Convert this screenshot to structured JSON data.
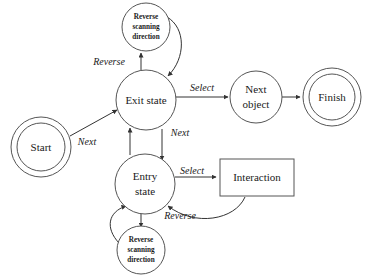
{
  "diagram": {
    "background_color": "#ffffff",
    "stroke_color": "#555555",
    "edge_color": "#333333",
    "text_color": "#1a1a1a",
    "nodes": [
      {
        "id": "start",
        "kind": "double-circle",
        "label": "Start",
        "cx": 41,
        "cy": 147,
        "r": 30,
        "r_inner": 24
      },
      {
        "id": "exit-state",
        "kind": "circle",
        "label": "Exit state",
        "cx": 146,
        "cy": 100,
        "r": 30
      },
      {
        "id": "entry-state",
        "kind": "circle",
        "label_line1": "Entry",
        "label_line2": "state",
        "cx": 145,
        "cy": 184,
        "r": 30
      },
      {
        "id": "reverse-scanning-direction-top",
        "kind": "circle-small",
        "label_line1": "Reverse",
        "label_line2": "scanning",
        "label_line3": "direction",
        "cx": 146,
        "cy": 27,
        "r": 24
      },
      {
        "id": "reverse-scanning-direction-bottom",
        "kind": "circle-small",
        "label_line1": "Reverse",
        "label_line2": "scanning",
        "label_line3": "direction",
        "cx": 141,
        "cy": 250,
        "r": 24
      },
      {
        "id": "next-object",
        "kind": "circle",
        "label_line1": "Next",
        "label_line2": "object",
        "cx": 256,
        "cy": 97,
        "r": 26
      },
      {
        "id": "finish",
        "kind": "double-circle",
        "label": "Finish",
        "cx": 332,
        "cy": 97,
        "r": 29,
        "r_inner": 23
      },
      {
        "id": "interaction",
        "kind": "rect",
        "label": "Interaction",
        "x": 220,
        "y": 159,
        "width": 74,
        "height": 37
      }
    ],
    "edges": [
      {
        "id": "start-to-exit",
        "label": "Next",
        "label_x": 87,
        "label_y": 143,
        "from": "start",
        "to": "exit-state"
      },
      {
        "id": "exit-to-reverse-top",
        "label": "Reverse",
        "label_x": 109,
        "label_y": 63,
        "from": "exit-state",
        "to": "reverse-scanning-direction-top"
      },
      {
        "id": "reverse-top-to-exit",
        "label": "",
        "from": "reverse-scanning-direction-top",
        "to": "exit-state"
      },
      {
        "id": "exit-to-next-object",
        "label": "Select",
        "label_x": 202,
        "label_y": 89,
        "from": "exit-state",
        "to": "next-object"
      },
      {
        "id": "next-object-to-finish",
        "label": "",
        "from": "next-object",
        "to": "finish"
      },
      {
        "id": "exit-to-entry",
        "label": "Next",
        "label_x": 180,
        "label_y": 134,
        "from": "exit-state",
        "to": "entry-state"
      },
      {
        "id": "entry-to-exit",
        "label": "",
        "from": "entry-state",
        "to": "exit-state"
      },
      {
        "id": "entry-to-interaction",
        "label": "Select",
        "label_x": 192,
        "label_y": 172,
        "from": "entry-state",
        "to": "interaction"
      },
      {
        "id": "interaction-to-entry",
        "label": "",
        "from": "interaction",
        "to": "entry-state"
      },
      {
        "id": "entry-to-reverse-bottom",
        "label": "Reverse",
        "label_x": 180,
        "label_y": 217,
        "from": "entry-state",
        "to": "reverse-scanning-direction-bottom"
      },
      {
        "id": "reverse-bottom-to-entry",
        "label": "",
        "from": "reverse-scanning-direction-bottom",
        "to": "entry-state"
      }
    ]
  }
}
